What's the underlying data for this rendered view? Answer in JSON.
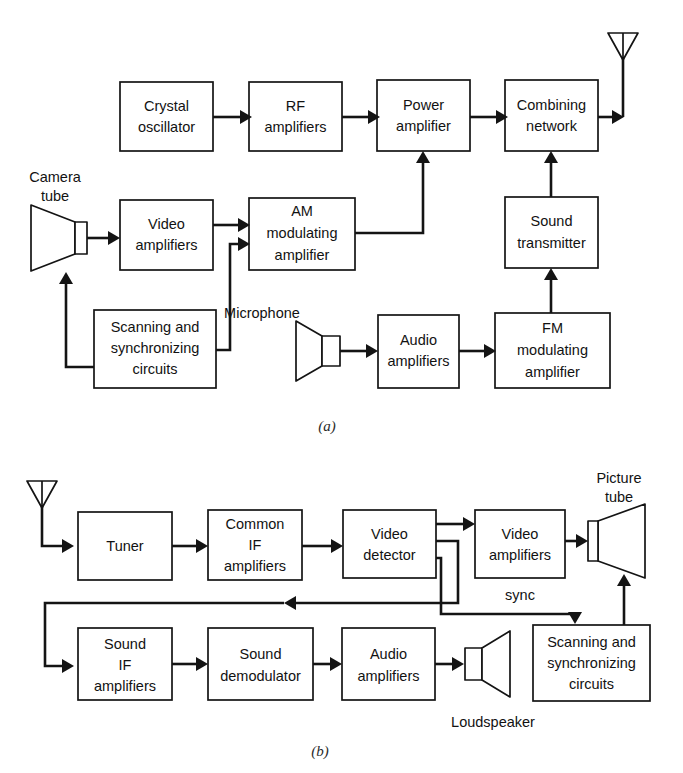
{
  "figure": {
    "panels": [
      {
        "id": "a",
        "caption": "(a)",
        "caption_x": 327,
        "caption_y": 431
      },
      {
        "id": "b",
        "caption": "(b)",
        "caption_x": 320,
        "caption_y": 754
      }
    ]
  },
  "panel_a": {
    "name": "television-transmitter-block-diagram",
    "blocks": [
      {
        "key": "crystal_oscillator",
        "lines": [
          "Crystal",
          "oscillator"
        ],
        "x": 120,
        "y": 82,
        "w": 93,
        "h": 69
      },
      {
        "key": "rf_amplifiers",
        "lines": [
          "RF",
          "amplifiers"
        ],
        "x": 249,
        "y": 82,
        "w": 93,
        "h": 69
      },
      {
        "key": "power_amplifier",
        "lines": [
          "Power",
          "amplifier"
        ],
        "x": 377,
        "y": 80,
        "w": 93,
        "h": 71
      },
      {
        "key": "combining_network",
        "lines": [
          "Combining",
          "network"
        ],
        "x": 505,
        "y": 80,
        "w": 93,
        "h": 71
      },
      {
        "key": "video_amplifiers",
        "lines": [
          "Video",
          "amplifiers"
        ],
        "x": 120,
        "y": 200,
        "w": 93,
        "h": 70
      },
      {
        "key": "am_modulating_amplifier",
        "lines": [
          "AM",
          "modulating",
          "amplifier"
        ],
        "x": 249,
        "y": 198,
        "w": 106,
        "h": 72
      },
      {
        "key": "sound_transmitter",
        "lines": [
          "Sound",
          "transmitter"
        ],
        "x": 505,
        "y": 197,
        "w": 93,
        "h": 71
      },
      {
        "key": "scanning_sync_circuits",
        "lines": [
          "Scanning and",
          "synchronizing",
          "circuits"
        ],
        "x": 94,
        "y": 310,
        "w": 122,
        "h": 78
      },
      {
        "key": "audio_amplifiers",
        "lines": [
          "Audio",
          "amplifiers"
        ],
        "x": 378,
        "y": 315,
        "w": 81,
        "h": 73
      },
      {
        "key": "fm_modulating_amplifier",
        "lines": [
          "FM",
          "modulating",
          "amplifier"
        ],
        "x": 495,
        "y": 313,
        "w": 115,
        "h": 75
      }
    ],
    "devices": [
      {
        "key": "camera_tube",
        "label_lines": [
          "Camera",
          "tube"
        ],
        "label_x": 55,
        "label_y": 177,
        "label_y2": 196
      },
      {
        "key": "microphone",
        "label": "Microphone",
        "label_x": 262,
        "label_y": 313
      },
      {
        "key": "transmit_antenna",
        "label": ""
      }
    ]
  },
  "panel_b": {
    "name": "television-receiver-block-diagram",
    "blocks": [
      {
        "key": "tuner",
        "lines": [
          "Tuner"
        ],
        "x": 78,
        "y": 512,
        "w": 94,
        "h": 68
      },
      {
        "key": "common_if_amplifiers",
        "lines": [
          "Common",
          "IF",
          "amplifiers"
        ],
        "x": 208,
        "y": 510,
        "w": 94,
        "h": 70
      },
      {
        "key": "video_detector",
        "lines": [
          "Video",
          "detector"
        ],
        "x": 343,
        "y": 510,
        "w": 93,
        "h": 68
      },
      {
        "key": "video_amplifiers",
        "lines": [
          "Video",
          "amplifiers"
        ],
        "x": 475,
        "y": 510,
        "w": 90,
        "h": 68
      },
      {
        "key": "sound_if_amplifiers",
        "lines": [
          "Sound",
          "IF",
          "amplifiers"
        ],
        "x": 78,
        "y": 628,
        "w": 94,
        "h": 72
      },
      {
        "key": "sound_demodulator",
        "lines": [
          "Sound",
          "demodulator"
        ],
        "x": 208,
        "y": 628,
        "w": 105,
        "h": 72
      },
      {
        "key": "audio_amplifiers",
        "lines": [
          "Audio",
          "amplifiers"
        ],
        "x": 342,
        "y": 628,
        "w": 93,
        "h": 72
      },
      {
        "key": "scanning_sync_circuits",
        "lines": [
          "Scanning and",
          "synchronizing",
          "circuits"
        ],
        "x": 533,
        "y": 625,
        "w": 117,
        "h": 76
      }
    ],
    "devices": [
      {
        "key": "receive_antenna",
        "label": ""
      },
      {
        "key": "picture_tube",
        "label_lines": [
          "Picture",
          "tube"
        ],
        "label_x": 619,
        "label_y": 478,
        "label_y2": 497
      },
      {
        "key": "loudspeaker",
        "label": "Loudspeaker",
        "label_x": 490,
        "label_y": 722
      }
    ],
    "annotations": [
      {
        "key": "sync_label",
        "text": "sync",
        "x": 520,
        "y": 595
      }
    ]
  },
  "colors": {
    "line": "#141414",
    "background": "#ffffff",
    "text": "#121212"
  }
}
